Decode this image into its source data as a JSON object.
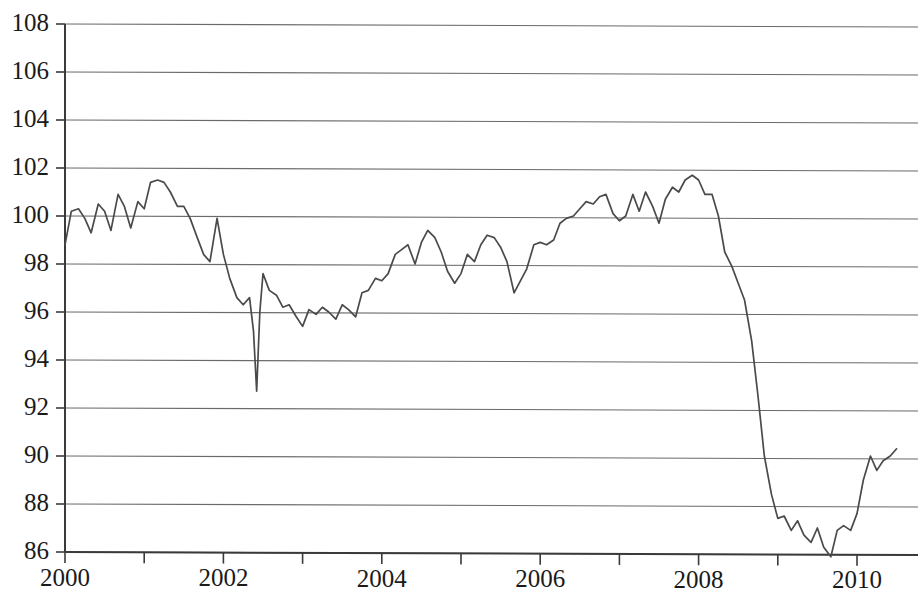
{
  "chart_data": {
    "type": "line",
    "title": "",
    "subtitle": "",
    "xlabel": "",
    "ylabel": "",
    "xlim": [
      2000.0,
      2010.6
    ],
    "ylim": [
      86,
      108
    ],
    "grid": true,
    "legend": false,
    "legend_position": "none",
    "y_ticks": [
      86,
      88,
      90,
      92,
      94,
      96,
      98,
      100,
      102,
      104,
      106,
      108
    ],
    "y_tick_labels": [
      "86",
      "88",
      "90",
      "92",
      "94",
      "96",
      "98",
      "100",
      "102",
      "104",
      "106",
      "108"
    ],
    "x_ticks": [
      2000,
      2002,
      2004,
      2006,
      2008,
      2010
    ],
    "x_tick_labels": [
      "2000",
      "2002",
      "2004",
      "2006",
      "2008",
      "2010"
    ],
    "x_minor_ticks": [
      2001,
      2003,
      2005,
      2007,
      2009
    ],
    "line_color": "#4a4a4a",
    "grid_color": "#6b6b6b",
    "axis_color": "#3a3a3a",
    "series": [
      {
        "name": "index",
        "x": [
          2000.0,
          2000.08,
          2000.17,
          2000.25,
          2000.33,
          2000.42,
          2000.5,
          2000.58,
          2000.67,
          2000.75,
          2000.83,
          2000.92,
          2001.0,
          2001.08,
          2001.17,
          2001.25,
          2001.33,
          2001.42,
          2001.5,
          2001.58,
          2001.67,
          2001.75,
          2001.83,
          2001.92,
          2002.0,
          2002.08,
          2002.17,
          2002.25,
          2002.33,
          2002.38,
          2002.42,
          2002.46,
          2002.5,
          2002.58,
          2002.67,
          2002.75,
          2002.83,
          2002.92,
          2003.0,
          2003.08,
          2003.17,
          2003.25,
          2003.33,
          2003.42,
          2003.5,
          2003.58,
          2003.67,
          2003.75,
          2003.83,
          2003.92,
          2004.0,
          2004.08,
          2004.17,
          2004.25,
          2004.33,
          2004.42,
          2004.5,
          2004.58,
          2004.67,
          2004.75,
          2004.83,
          2004.92,
          2005.0,
          2005.08,
          2005.17,
          2005.25,
          2005.33,
          2005.42,
          2005.5,
          2005.58,
          2005.67,
          2005.75,
          2005.83,
          2005.92,
          2006.0,
          2006.08,
          2006.17,
          2006.25,
          2006.33,
          2006.42,
          2006.5,
          2006.58,
          2006.67,
          2006.75,
          2006.83,
          2006.92,
          2007.0,
          2007.08,
          2007.17,
          2007.25,
          2007.33,
          2007.42,
          2007.5,
          2007.58,
          2007.67,
          2007.75,
          2007.83,
          2007.92,
          2008.0,
          2008.08,
          2008.17,
          2008.25,
          2008.33,
          2008.42,
          2008.5,
          2008.58,
          2008.67,
          2008.75,
          2008.83,
          2008.92,
          2009.0,
          2009.08,
          2009.17,
          2009.25,
          2009.33,
          2009.42,
          2009.5,
          2009.58,
          2009.67,
          2009.75,
          2009.83,
          2009.92,
          2010.0,
          2010.08,
          2010.17,
          2010.25,
          2010.33,
          2010.42,
          2010.5
        ],
        "y": [
          98.8,
          100.2,
          100.3,
          99.9,
          99.3,
          100.5,
          100.2,
          99.4,
          100.9,
          100.4,
          99.5,
          100.6,
          100.3,
          101.4,
          101.5,
          101.4,
          101.0,
          100.4,
          100.4,
          99.9,
          99.1,
          98.4,
          98.1,
          99.9,
          98.4,
          97.4,
          96.6,
          96.3,
          96.6,
          95.2,
          92.7,
          96.0,
          97.6,
          96.9,
          96.7,
          96.2,
          96.3,
          95.8,
          95.4,
          96.1,
          95.9,
          96.2,
          96.0,
          95.7,
          96.3,
          96.1,
          95.8,
          96.8,
          96.9,
          97.4,
          97.3,
          97.6,
          98.4,
          98.6,
          98.8,
          98.0,
          98.9,
          99.4,
          99.1,
          98.5,
          97.7,
          97.2,
          97.6,
          98.4,
          98.1,
          98.8,
          99.2,
          99.1,
          98.7,
          98.1,
          96.8,
          97.3,
          97.8,
          98.8,
          98.9,
          98.8,
          99.0,
          99.7,
          99.9,
          100.0,
          100.3,
          100.6,
          100.5,
          100.8,
          100.9,
          100.1,
          99.8,
          100.0,
          100.9,
          100.2,
          101.0,
          100.4,
          99.7,
          100.7,
          101.2,
          101.0,
          101.5,
          101.7,
          101.5,
          100.9,
          100.9,
          100.0,
          98.5,
          97.9,
          97.2,
          96.5,
          94.8,
          92.5,
          90.0,
          88.4,
          87.4,
          87.5,
          86.9,
          87.3,
          86.7,
          86.4,
          87.0,
          86.2,
          85.8,
          86.9,
          87.1,
          86.9,
          87.6,
          89.0,
          90.0,
          89.4,
          89.8,
          90.0,
          90.3
        ]
      }
    ]
  },
  "axes": {
    "y_axis_name": "value-axis",
    "x_axis_name": "year-axis"
  }
}
